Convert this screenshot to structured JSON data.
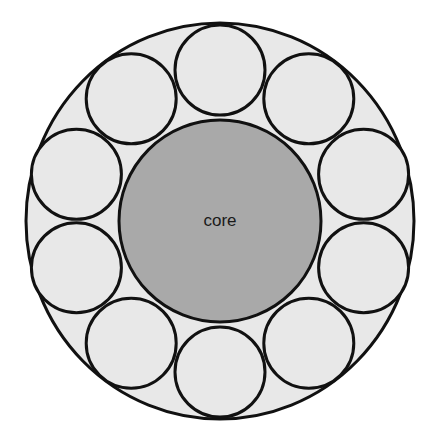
{
  "diagram": {
    "type": "cross-section",
    "outer": {
      "cx": 220,
      "cy": 221,
      "rx": 194,
      "ry": 198,
      "fill": "#e8e8e8",
      "stroke": "#111111"
    },
    "core": {
      "cx": 220,
      "cy": 221,
      "r": 101,
      "fill": "#a9a9a9",
      "stroke": "#111111",
      "label": "core"
    },
    "strands": {
      "count": 10,
      "ring_radius": 151,
      "r": 45,
      "start_angle_deg": -90,
      "fill": "#e8e8e8",
      "stroke": "#111111"
    },
    "stroke_width": 3
  }
}
